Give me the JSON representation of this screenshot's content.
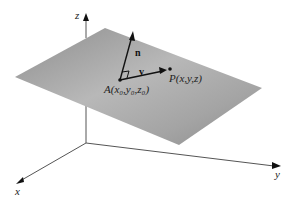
{
  "diagram": {
    "axes": {
      "x": {
        "label": "x"
      },
      "y": {
        "label": "y"
      },
      "z": {
        "label": "z"
      }
    },
    "vectors": {
      "normal": {
        "label": "n"
      },
      "v": {
        "label": "v"
      }
    },
    "points": {
      "A": {
        "label": "A(x₀,y₀,z₀)"
      },
      "P": {
        "label": "P(x,y,z)"
      }
    },
    "colors": {
      "plane_dark": "#8a8a8a",
      "plane_light": "#c4c4c4",
      "axis": "#444444",
      "vector": "#111111"
    }
  }
}
